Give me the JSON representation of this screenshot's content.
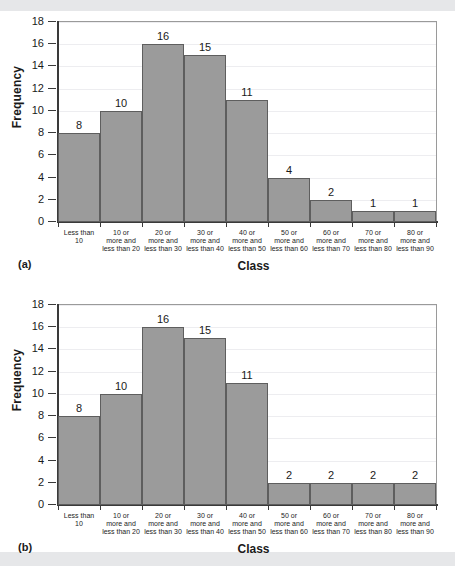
{
  "figure": {
    "panels": [
      {
        "panel_label": "(a)",
        "chart_data": {
          "type": "bar",
          "title": "",
          "xlabel": "Class",
          "ylabel": "Frequency",
          "ylim": [
            0,
            18
          ],
          "ytick_labels": [
            "0",
            "2",
            "4",
            "6",
            "8",
            "10",
            "12",
            "14",
            "16",
            "18"
          ],
          "ytick_values": [
            0,
            2,
            4,
            6,
            8,
            10,
            12,
            14,
            16,
            18
          ],
          "grid": true,
          "legend": "none",
          "categories": [
            "Less than 10",
            "10 or more and less than 20",
            "20 or more and less than 30",
            "30 or more and less than 40",
            "40 or more and less than 50",
            "50 or more and less than 60",
            "60 or more and less than 70",
            "70 or more and less than 80",
            "80 or more and less than 90"
          ],
          "category_lines": [
            [
              "Less than",
              "10"
            ],
            [
              "10 or",
              "more and",
              "less than 20"
            ],
            [
              "20 or",
              "more and",
              "less than 30"
            ],
            [
              "30 or",
              "more and",
              "less than 40"
            ],
            [
              "40 or",
              "more and",
              "less than 50"
            ],
            [
              "50 or",
              "more and",
              "less than 60"
            ],
            [
              "60 or",
              "more and",
              "less than 70"
            ],
            [
              "70 or",
              "more and",
              "less than 80"
            ],
            [
              "80 or",
              "more and",
              "less than 90"
            ]
          ],
          "values": [
            8,
            10,
            16,
            15,
            11,
            4,
            2,
            1,
            1
          ],
          "data_labels": [
            "8",
            "10",
            "16",
            "15",
            "11",
            "4",
            "2",
            "1",
            "1"
          ],
          "bar_fill": "#9b9b9b",
          "bar_border": "#5e5e5e"
        }
      },
      {
        "panel_label": "(b)",
        "chart_data": {
          "type": "bar",
          "title": "",
          "xlabel": "Class",
          "ylabel": "Frequency",
          "ylim": [
            0,
            18
          ],
          "ytick_labels": [
            "0",
            "2",
            "4",
            "6",
            "8",
            "10",
            "12",
            "14",
            "16",
            "18"
          ],
          "ytick_values": [
            0,
            2,
            4,
            6,
            8,
            10,
            12,
            14,
            16,
            18
          ],
          "grid": true,
          "legend": "none",
          "categories": [
            "Less than 10",
            "10 or more and less than 20",
            "20 or more and less than 30",
            "30 or more and less than 40",
            "40 or more and less than 50",
            "50 or more and less than 60",
            "60 or more and less than 70",
            "70 or more and less than 80",
            "80 or more and less than 90"
          ],
          "category_lines": [
            [
              "Less than",
              "10"
            ],
            [
              "10 or",
              "more and",
              "less than 20"
            ],
            [
              "20 or",
              "more and",
              "less than 30"
            ],
            [
              "30 or",
              "more and",
              "less than 40"
            ],
            [
              "40 or",
              "more and",
              "less than 50"
            ],
            [
              "50 or",
              "more and",
              "less than 60"
            ],
            [
              "60 or",
              "more and",
              "less than 70"
            ],
            [
              "70 or",
              "more and",
              "less than 80"
            ],
            [
              "80 or",
              "more and",
              "less than 90"
            ]
          ],
          "values": [
            8,
            10,
            16,
            15,
            11,
            2,
            2,
            2,
            2
          ],
          "data_labels": [
            "8",
            "10",
            "16",
            "15",
            "11",
            "2",
            "2",
            "2",
            "2"
          ],
          "bar_fill": "#9b9b9b",
          "bar_border": "#5e5e5e"
        }
      }
    ]
  }
}
